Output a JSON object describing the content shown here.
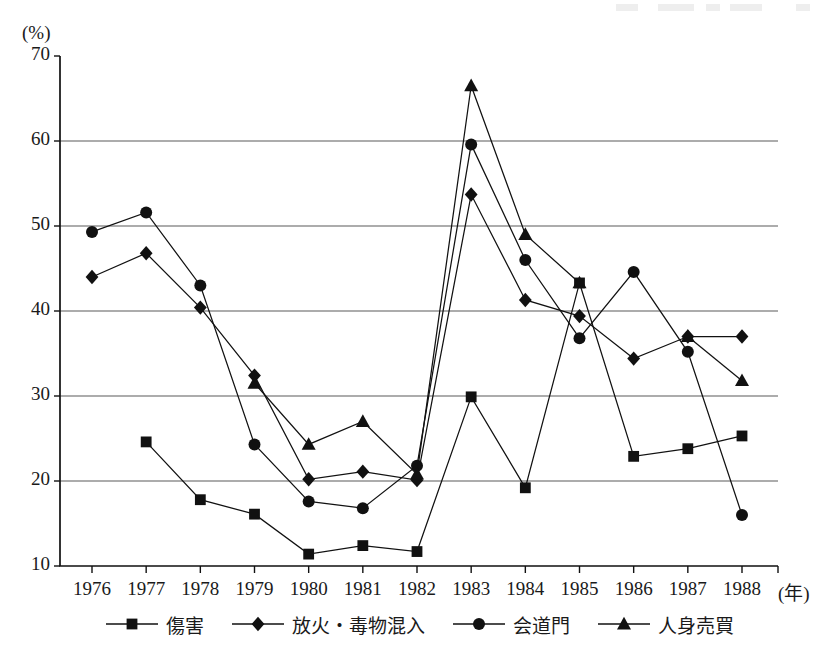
{
  "chart_data": {
    "type": "line",
    "title": "",
    "xlabel": "年",
    "ylabel": "(%)",
    "unit_label": "(%)",
    "x_unit_suffix": "(年)",
    "categories": [
      "1976",
      "1977",
      "1978",
      "1979",
      "1980",
      "1981",
      "1982",
      "1983",
      "1984",
      "1985",
      "1986",
      "1987",
      "1988"
    ],
    "ylim": [
      10,
      70
    ],
    "yticks": [
      10,
      20,
      30,
      40,
      50,
      60,
      70
    ],
    "grid": "horizontal",
    "legend_position": "bottom",
    "series": [
      {
        "name": "傷害",
        "marker": "square",
        "values": [
          null,
          24.6,
          17.8,
          16.1,
          11.4,
          12.4,
          11.7,
          29.9,
          19.2,
          43.3,
          22.9,
          23.8,
          25.3
        ]
      },
      {
        "name": "放火・毒物混入",
        "marker": "diamond",
        "values": [
          44.0,
          46.8,
          40.4,
          32.4,
          20.2,
          21.1,
          20.1,
          53.7,
          41.3,
          39.4,
          34.4,
          37.0,
          37.0
        ]
      },
      {
        "name": "会道門",
        "marker": "circle",
        "values": [
          49.3,
          51.6,
          43.0,
          24.3,
          17.6,
          16.8,
          21.8,
          59.6,
          46.0,
          36.8,
          44.6,
          35.2,
          16.0
        ]
      },
      {
        "name": "人身売買",
        "marker": "triangle",
        "values": [
          null,
          null,
          null,
          31.5,
          24.3,
          27.0,
          20.8,
          66.5,
          49.0,
          43.3,
          null,
          37.0,
          31.8
        ]
      }
    ]
  },
  "legend": {
    "items": [
      {
        "label": "傷害",
        "marker": "square"
      },
      {
        "label": "放火・毒物混入",
        "marker": "diamond"
      },
      {
        "label": "会道門",
        "marker": "circle"
      },
      {
        "label": "人身売買",
        "marker": "triangle"
      }
    ]
  },
  "colors": {
    "ink": "#111111",
    "grid": "#5a5a5a",
    "axis": "#111111",
    "background": "#ffffff"
  }
}
